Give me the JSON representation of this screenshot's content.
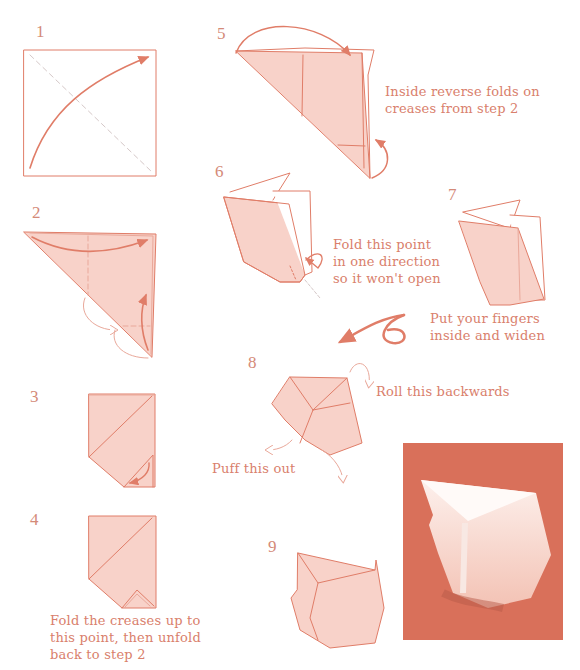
{
  "diagram": {
    "colors": {
      "line": "#e07d68",
      "paper_fill": "#f8d2c9",
      "paper_fill_light": "#fbe3dd",
      "crease": "#e9a89a",
      "valley_dash": "#d5c8c8",
      "text": "#d9806c",
      "photo_bg": "#d9705a"
    },
    "steps": [
      {
        "number": "1",
        "caption": ""
      },
      {
        "number": "2",
        "caption": ""
      },
      {
        "number": "3",
        "caption": ""
      },
      {
        "number": "4",
        "caption_lines": [
          "Fold the creases up to",
          "this point, then unfold",
          "back to step 2"
        ]
      },
      {
        "number": "5",
        "caption_lines": [
          "Inside reverse folds on",
          "creases from step 2"
        ]
      },
      {
        "number": "6",
        "caption_lines": [
          "Fold this point",
          "in one direction",
          "so it won't open"
        ]
      },
      {
        "number": "7",
        "caption_lines": [
          "Put your fingers",
          "inside and widen"
        ]
      },
      {
        "number": "8",
        "captions": {
          "roll": "Roll this backwards",
          "puff": "Puff this out"
        }
      },
      {
        "number": "9",
        "caption": ""
      }
    ],
    "photo": {
      "description": "photograph of finished folded model"
    }
  }
}
